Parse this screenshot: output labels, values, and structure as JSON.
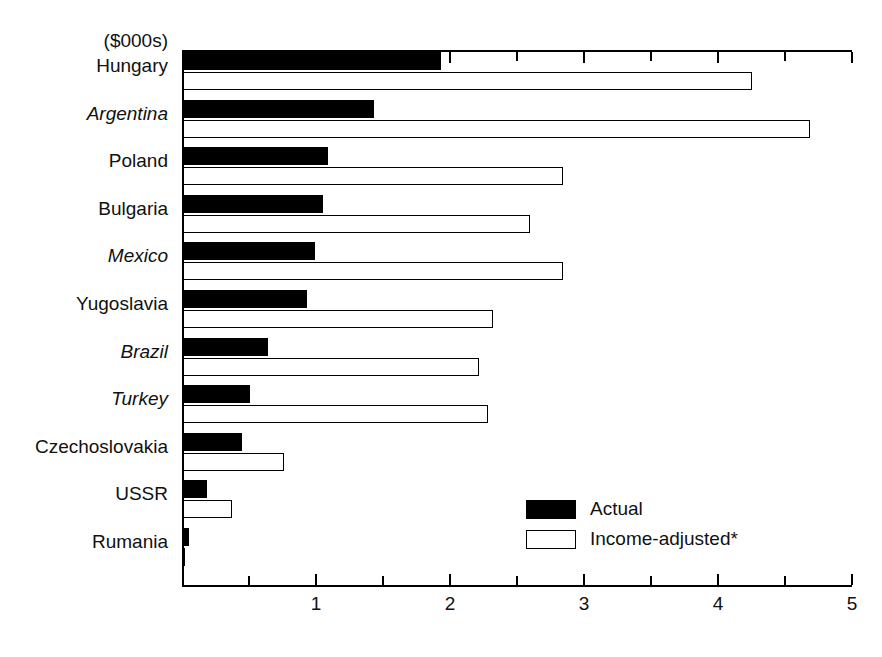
{
  "chart_data": {
    "type": "bar",
    "orientation": "horizontal",
    "title": "",
    "subtitle": "",
    "unit_label": "($000s)",
    "xlabel": "",
    "ylabel": "",
    "xlim": [
      0,
      5
    ],
    "x_major_ticks": [
      1,
      2,
      3,
      4,
      5
    ],
    "x_tick_labels": [
      "1",
      "2",
      "3",
      "4",
      "5"
    ],
    "x_minor_ticks": [
      0.5,
      1.5,
      2.5,
      3.5,
      4.5
    ],
    "grid": false,
    "legend_position": "inside-lower-right",
    "categories": [
      "Hungary",
      "Argentina",
      "Poland",
      "Bulgaria",
      "Mexico",
      "Yugoslavia",
      "Brazil",
      "Turkey",
      "Czechoslovakia",
      "USSR",
      "Rumania"
    ],
    "category_styles": [
      "normal",
      "italic",
      "normal",
      "normal",
      "italic",
      "normal",
      "italic",
      "italic",
      "normal",
      "normal",
      "normal"
    ],
    "series": [
      {
        "name": "Actual",
        "fill": "#000000",
        "values": [
          1.93,
          1.43,
          1.09,
          1.05,
          0.99,
          0.93,
          0.64,
          0.51,
          0.45,
          0.19,
          0.05
        ]
      },
      {
        "name": "Income-adjusted*",
        "fill": "#ffffff",
        "values": [
          4.25,
          4.69,
          2.84,
          2.6,
          2.84,
          2.32,
          2.22,
          2.28,
          0.76,
          0.37,
          0.02
        ]
      }
    ]
  },
  "legend": {
    "items": [
      {
        "label": "Actual",
        "style": "filled"
      },
      {
        "label": "Income-adjusted*",
        "style": "hollow"
      }
    ]
  },
  "colors": {
    "actual": "#000000",
    "adjusted": "#ffffff",
    "axis": "#000000",
    "text": "#111111"
  }
}
